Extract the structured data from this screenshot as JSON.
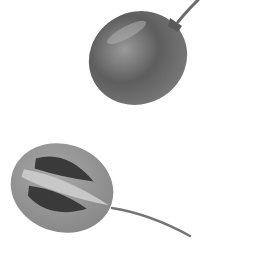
{
  "image": {
    "subject": "Two tamarillo (tree tomato) fruits in grayscale",
    "colors": {
      "background": "#ffffff",
      "whole_fruit_light": "#8a8a8a",
      "whole_fruit_dark": "#4a4a4a",
      "cut_fruit_flesh": "#9a9a9a",
      "seed_cavity": "#3a3a3a",
      "core": "#c8c8c8",
      "stem": "#707070"
    },
    "objects": [
      {
        "name": "whole-fruit",
        "description": "whole egg-shaped fruit with stem at top right"
      },
      {
        "name": "halved-fruit",
        "description": "halved fruit showing seeds and pale core, with long stem to lower right"
      }
    ]
  }
}
